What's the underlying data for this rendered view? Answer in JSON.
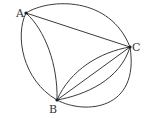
{
  "diagram": {
    "type": "multigraph",
    "vertices": [
      {
        "id": "A",
        "label": "A",
        "x": 26,
        "y": 13
      },
      {
        "id": "B",
        "label": "B",
        "x": 57,
        "y": 100
      },
      {
        "id": "C",
        "label": "C",
        "x": 130,
        "y": 47
      }
    ],
    "edges": [
      {
        "from": "A",
        "to": "C",
        "shape": "straight"
      },
      {
        "from": "A",
        "to": "C",
        "shape": "arc-outer"
      },
      {
        "from": "A",
        "to": "B",
        "shape": "arc-outer-left"
      },
      {
        "from": "A",
        "to": "B",
        "shape": "arc-inner"
      },
      {
        "from": "B",
        "to": "C",
        "shape": "straight"
      },
      {
        "from": "B",
        "to": "C",
        "shape": "arc-upper"
      },
      {
        "from": "B",
        "to": "C",
        "shape": "arc-lower"
      },
      {
        "from": "B",
        "to": "C",
        "shape": "arc-outer"
      }
    ],
    "edge_count": {
      "AC": 2,
      "AB": 2,
      "BC": 4
    },
    "colors": {
      "stroke": "#3a3a3a",
      "vertex": "#1a1a1a",
      "label": "#333333",
      "background": "#ffffff"
    }
  }
}
